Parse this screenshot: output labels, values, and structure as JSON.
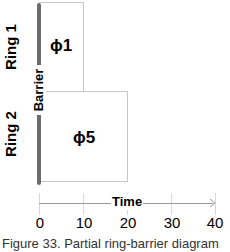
{
  "diagram": {
    "rings": [
      {
        "label": "Ring 1",
        "phase": "ϕ1",
        "start": 0,
        "end": 10
      },
      {
        "label": "Ring 2",
        "phase": "ϕ5",
        "start": 0,
        "end": 20
      }
    ],
    "barrier_label": "Barrier",
    "axis": {
      "label": "Time",
      "ticks": [
        "0",
        "10",
        "20",
        "30",
        "40"
      ],
      "range": [
        0,
        40
      ]
    },
    "caption_partial": "Figure 33. Partial ring-barrier diagram"
  },
  "colors": {
    "barrier": "#6b6b6b",
    "box_border": "#c8c8c8",
    "gridline": "#d8d8d8",
    "axis": "#9a9a9a"
  }
}
